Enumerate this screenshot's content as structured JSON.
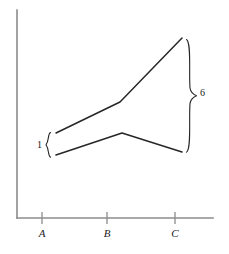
{
  "chart_data": {
    "type": "line",
    "title": "",
    "subtitle": "",
    "xlabel": "",
    "ylabel": "",
    "grid": false,
    "legend": false,
    "xlim": [
      0,
      229
    ],
    "ylim": [
      0,
      254
    ],
    "categories": [
      "A",
      "B",
      "C"
    ],
    "annotations": [
      {
        "name": "left-brace-label",
        "text": "1",
        "meaning": "gap between the two curves at the left edge"
      },
      {
        "name": "right-brace-label",
        "text": "6",
        "meaning": "gap between the two curves at the right edge"
      }
    ],
    "series": [
      {
        "name": "upper-curve",
        "points": [
          {
            "x": 56,
            "y": 133
          },
          {
            "x": 120,
            "y": 102
          },
          {
            "x": 182,
            "y": 38
          }
        ]
      },
      {
        "name": "lower-curve",
        "points": [
          {
            "x": 56,
            "y": 155
          },
          {
            "x": 122,
            "y": 133
          },
          {
            "x": 182,
            "y": 152
          }
        ]
      }
    ]
  },
  "axes": {
    "y_axis": {
      "name": "y-axis",
      "x": 17,
      "y_top": 10,
      "y_bottom": 218
    },
    "x_axis": {
      "name": "x-axis",
      "y": 218,
      "x_left": 17,
      "x_right": 213
    },
    "ticks": [
      {
        "label": "A",
        "x": 42
      },
      {
        "label": "B",
        "x": 107
      },
      {
        "label": "C",
        "x": 175
      }
    ],
    "tick_label_y": 228
  },
  "braces": {
    "left": {
      "label": "1",
      "x": 50,
      "y_top": 133,
      "y_bottom": 157,
      "tip_x": 45
    },
    "right": {
      "label": "6",
      "x": 188,
      "y_top": 40,
      "y_bottom": 152,
      "tip_x": 197
    }
  },
  "style": {
    "stroke": "#262626",
    "axis_stroke": "#8c8c8c",
    "background": "#ffffff",
    "text_color": "#1a1a1a"
  }
}
